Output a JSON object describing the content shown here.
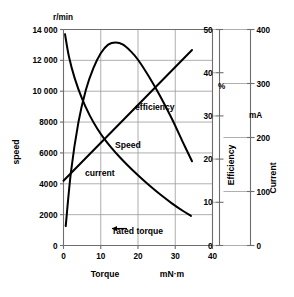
{
  "chart_data": {
    "type": "line",
    "title": "",
    "xlabel": "Torque",
    "x_units": "mN·m",
    "xlim": [
      0,
      40
    ],
    "xticks": [
      0,
      10,
      20,
      30,
      40
    ],
    "grid": true,
    "legend_position": "inline-annotations",
    "axes": [
      {
        "id": "speed",
        "position": "left",
        "title": "speed",
        "units": "r/min",
        "lim": [
          0,
          14000
        ],
        "ticks": [
          0,
          2000,
          4000,
          6000,
          8000,
          10000,
          12000,
          14000
        ],
        "ticklabels": [
          "0",
          "2000",
          "4000",
          "6000",
          "8000",
          "10 000",
          "12 000",
          "14 000"
        ]
      },
      {
        "id": "efficiency",
        "position": "right-inner",
        "title": "Efficiency",
        "units": "%",
        "lim": [
          0,
          50
        ],
        "ticks": [
          0,
          10,
          20,
          30,
          40,
          50
        ],
        "ticklabels": [
          "0",
          "10",
          "20",
          "30",
          "40",
          "50"
        ]
      },
      {
        "id": "current",
        "position": "right-outer",
        "title": "Current",
        "units": "mA",
        "lim": [
          0,
          400
        ],
        "ticks": [
          0,
          100,
          200,
          300,
          400
        ],
        "ticklabels": [
          "0",
          "100",
          "200",
          "300",
          "400"
        ]
      }
    ],
    "series": [
      {
        "name": "Speed",
        "label": "Speed",
        "axis": "speed",
        "color": "#000000",
        "x": [
          0.4,
          1.5,
          3,
          5,
          7,
          9,
          11,
          13,
          15,
          17,
          20,
          23,
          26,
          29,
          32,
          34.2
        ],
        "values": [
          13700,
          12200,
          10850,
          9500,
          8450,
          7600,
          6900,
          6300,
          5750,
          5250,
          4550,
          3900,
          3300,
          2750,
          2250,
          1920
        ]
      },
      {
        "name": "efficiency",
        "label": "efficiency",
        "axis": "efficiency",
        "color": "#000000",
        "x": [
          0.6,
          2,
          4,
          6,
          8,
          10,
          12,
          14,
          16,
          18,
          20,
          23,
          26,
          29,
          32,
          34.5
        ],
        "values": [
          4.5,
          17,
          28.5,
          36,
          41,
          44.5,
          46.5,
          47,
          46.5,
          45,
          43,
          39,
          34.5,
          29.5,
          24,
          19.5
        ]
      },
      {
        "name": "current",
        "label": "current",
        "axis": "current",
        "color": "#000000",
        "x": [
          0,
          34.5
        ],
        "values": [
          120,
          362
        ]
      }
    ],
    "annotations": [
      {
        "id": "rated-torque",
        "label": "rated torque",
        "x": 13,
        "y_speed": 1100,
        "arrow": "left"
      }
    ]
  },
  "labels": {
    "speed_unit": "r/min",
    "efficiency_unit": "%",
    "current_unit": "mA",
    "x_title": "Torque",
    "x_unit": "mN·m",
    "speed_axis_title": "speed",
    "efficiency_axis_title": "Efficiency",
    "current_axis_title": "Current",
    "series_speed": "Speed",
    "series_efficiency": "efficiency",
    "series_current": "current",
    "rated_torque": "rated torque"
  },
  "colors": {
    "curve": "#000000",
    "grid": "#9a9a9a",
    "axis": "#6e6e6e",
    "background": "#ffffff"
  }
}
